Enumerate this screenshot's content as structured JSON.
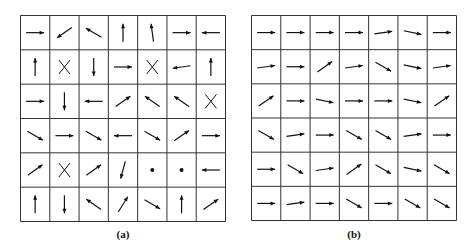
{
  "panels": [
    {
      "id": "a",
      "caption": "(a)",
      "rows": 6,
      "cols": 7,
      "cells": [
        [
          "E",
          "SW",
          "SE_up",
          "N",
          "N_tilt",
          "E",
          "W"
        ],
        [
          "N",
          "X",
          "S",
          "E",
          "X",
          "W_down",
          "N"
        ],
        [
          "E",
          "S",
          "W",
          "NE",
          "NW",
          "NW",
          "X"
        ],
        [
          "SE",
          "E",
          "SE",
          "W",
          "SE",
          "NE",
          "E"
        ],
        [
          "NE",
          "X",
          "NE",
          "S_tilt",
          "dot",
          "dot",
          "W"
        ],
        [
          "N",
          "S",
          "NW",
          "NE_steep",
          "SE",
          "N",
          "NE"
        ]
      ]
    },
    {
      "id": "b",
      "caption": "(b)",
      "rows": 6,
      "cols": 7,
      "cells": [
        [
          "E",
          "E",
          "E",
          "E",
          "E_up",
          "E_down",
          "E"
        ],
        [
          "E_up",
          "E",
          "NE",
          "E_up",
          "SE",
          "E_down",
          "E_up"
        ],
        [
          "NE",
          "E",
          "E_down",
          "E",
          "E",
          "E_down",
          "NE"
        ],
        [
          "SE",
          "E_up",
          "E",
          "SE",
          "SE",
          "E_up",
          "E"
        ],
        [
          "E",
          "SE",
          "E_up",
          "NE",
          "SE",
          "E_down",
          "SE"
        ],
        [
          "E",
          "E_up",
          "E",
          "SE",
          "E",
          "SE",
          "SE"
        ]
      ]
    }
  ],
  "colors": {
    "line": "#333333",
    "arrow": "#111111",
    "background": "#ffffff"
  }
}
